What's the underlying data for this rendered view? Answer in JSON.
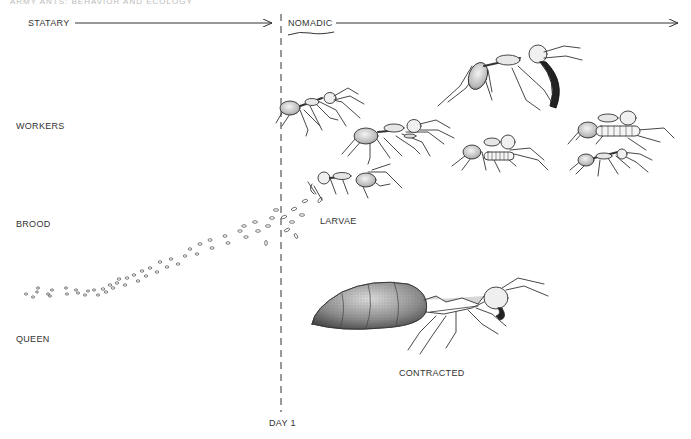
{
  "figure": {
    "running_head": "ARMY ANTS: BEHAVIOR AND ECOLOGY",
    "phases": {
      "statary": "STATARY",
      "nomadic": "NOMADIC"
    },
    "row_labels": {
      "workers": "WORKERS",
      "brood": "BROOD",
      "queen": "QUEEN"
    },
    "annotations": {
      "larvae": "LARVAE",
      "contracted": "CONTRACTED",
      "day_marker": "DAY 1"
    },
    "colors": {
      "ink": "#2a2a2a",
      "background": "#ffffff"
    }
  }
}
